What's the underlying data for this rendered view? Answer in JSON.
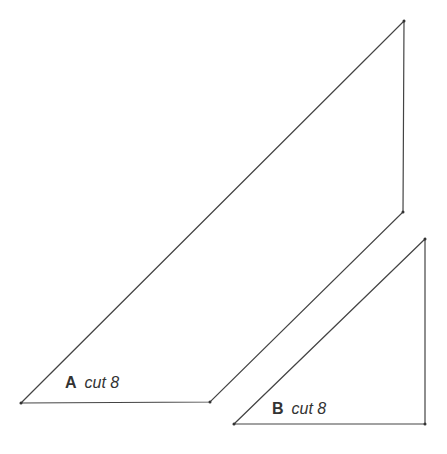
{
  "pieces": [
    {
      "id": "A",
      "letter": "A",
      "instruction": "cut 8",
      "points": [
        [
          404,
          21
        ],
        [
          403,
          212
        ],
        [
          210,
          402
        ],
        [
          21,
          403
        ]
      ]
    },
    {
      "id": "B",
      "letter": "B",
      "instruction": "cut 8",
      "points": [
        [
          425,
          239
        ],
        [
          425,
          424
        ],
        [
          234,
          424
        ]
      ]
    }
  ],
  "colors": {
    "stroke": "#444444",
    "text": "#333333"
  }
}
